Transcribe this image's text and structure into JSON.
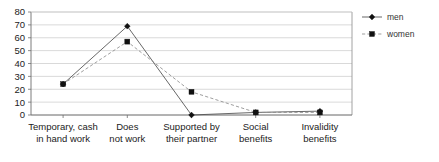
{
  "chart_data": {
    "type": "line",
    "title": "",
    "subtitle": "",
    "xlabel": "",
    "ylabel": "",
    "categories": [
      "Temporary, cash in hand work",
      "Does not work",
      "Supported by their partner",
      "Social benefits",
      "Invalidity benefits"
    ],
    "category_lines": [
      [
        "Temporary, cash",
        "in hand work"
      ],
      [
        "Does",
        "not work"
      ],
      [
        "Supported by",
        "their partner"
      ],
      [
        "Social",
        "benefits"
      ],
      [
        "Invalidity",
        "benefits"
      ]
    ],
    "series": [
      {
        "name": "men",
        "values": [
          24,
          69,
          0,
          2,
          3
        ],
        "marker": "diamond",
        "dash": "solid",
        "color": "#4d4d4d"
      },
      {
        "name": "women",
        "values": [
          24,
          57,
          18,
          2,
          2
        ],
        "marker": "square",
        "dash": "dashed",
        "color": "#8c8c8c"
      }
    ],
    "ylim": [
      0,
      80
    ],
    "yticks": [
      0,
      10,
      20,
      30,
      40,
      50,
      60,
      70,
      80
    ],
    "ytick_labels": [
      "0",
      "10",
      "20",
      "30",
      "40",
      "50",
      "60",
      "70",
      "80"
    ],
    "grid": true,
    "grid_axis": "y",
    "legend_position": "right",
    "legend_entries": [
      "men",
      "women"
    ]
  },
  "legend": {
    "items": [
      {
        "label": "men",
        "marker_icon": "diamond-marker-icon"
      },
      {
        "label": "women",
        "marker_icon": "square-marker-icon"
      }
    ]
  },
  "colors": {
    "men": "#4d4d4d",
    "women": "#8c8c8c",
    "grid": "#c9c9c9",
    "axis": "#6e6e6e",
    "text": "#222222",
    "background": "#ffffff"
  }
}
